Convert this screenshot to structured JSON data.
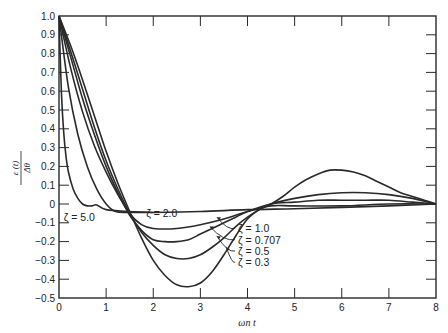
{
  "chart_data": {
    "type": "line",
    "title": "",
    "xlabel": "ωn t",
    "ylabel": "ε(t) / Δθ",
    "ylabel_num": "ε (t)",
    "ylabel_den": "Δθ",
    "xlim": [
      0,
      8
    ],
    "ylim": [
      -0.5,
      1.0
    ],
    "grid": false,
    "legend": "inline annotations",
    "x_ticks": [
      "0",
      "1",
      "2",
      "3",
      "4",
      "5",
      "6",
      "7",
      "8"
    ],
    "y_ticks": [
      "1.0",
      "0.9",
      "0.8",
      "0.7",
      "0.6",
      "0.5",
      "0.4",
      "0.3",
      "0.2",
      "0.1",
      "0",
      "-0.1",
      "-0.2",
      "-0.3",
      "-0.4",
      "-0.5"
    ],
    "series": [
      {
        "name": "ζ = 0.3",
        "x": [
          0,
          0.25,
          0.5,
          0.75,
          1.0,
          1.25,
          1.5,
          1.75,
          2.0,
          2.25,
          2.5,
          2.75,
          3.0,
          3.25,
          3.5,
          3.75,
          4.0,
          4.25,
          4.5,
          4.75,
          5.0,
          5.25,
          5.5,
          5.75,
          6.0,
          6.25,
          6.5,
          6.75,
          7.0,
          7.25,
          7.5,
          7.75,
          8.0
        ],
        "y": [
          1.0,
          0.84,
          0.66,
          0.47,
          0.28,
          0.11,
          -0.04,
          -0.18,
          -0.3,
          -0.38,
          -0.43,
          -0.44,
          -0.42,
          -0.36,
          -0.27,
          -0.17,
          -0.08,
          -0.03,
          0.0,
          0.04,
          0.09,
          0.13,
          0.16,
          0.18,
          0.18,
          0.17,
          0.15,
          0.12,
          0.09,
          0.06,
          0.04,
          0.02,
          0.0
        ]
      },
      {
        "name": "ζ = 0.5",
        "x": [
          0,
          0.25,
          0.5,
          0.75,
          1.0,
          1.25,
          1.5,
          1.75,
          2.0,
          2.25,
          2.5,
          2.75,
          3.0,
          3.25,
          3.5,
          3.75,
          4.0,
          4.25,
          4.5,
          5.0,
          5.5,
          6.0,
          6.5,
          7.0,
          7.5,
          8.0
        ],
        "y": [
          1.0,
          0.81,
          0.61,
          0.41,
          0.23,
          0.08,
          -0.05,
          -0.15,
          -0.22,
          -0.27,
          -0.29,
          -0.29,
          -0.27,
          -0.23,
          -0.18,
          -0.12,
          -0.07,
          -0.03,
          0.0,
          0.03,
          0.05,
          0.06,
          0.06,
          0.05,
          0.03,
          0.0
        ]
      },
      {
        "name": "ζ = 0.707",
        "x": [
          0,
          0.25,
          0.5,
          0.75,
          1.0,
          1.25,
          1.5,
          1.75,
          2.0,
          2.25,
          2.5,
          2.75,
          3.0,
          3.25,
          3.5,
          3.75,
          4.0,
          4.5,
          5.0,
          5.5,
          6.0,
          6.5,
          7.0,
          7.5,
          8.0
        ],
        "y": [
          1.0,
          0.78,
          0.56,
          0.37,
          0.2,
          0.06,
          -0.06,
          -0.14,
          -0.19,
          -0.2,
          -0.2,
          -0.19,
          -0.16,
          -0.13,
          -0.1,
          -0.07,
          -0.04,
          0.0,
          0.01,
          0.02,
          0.02,
          0.02,
          0.02,
          0.01,
          0.0
        ]
      },
      {
        "name": "ζ = 1.0",
        "x": [
          0,
          0.25,
          0.5,
          0.75,
          1.0,
          1.25,
          1.5,
          1.75,
          2.0,
          2.5,
          3.0,
          3.5,
          4.0,
          4.5,
          5.0,
          6.0,
          7.0,
          8.0
        ],
        "y": [
          1.0,
          0.72,
          0.49,
          0.31,
          0.17,
          0.05,
          -0.05,
          -0.11,
          -0.13,
          -0.13,
          -0.11,
          -0.08,
          -0.04,
          -0.01,
          -0.01,
          -0.01,
          0.0,
          0.0
        ]
      },
      {
        "name": "ζ = 2.0",
        "x": [
          0,
          0.2,
          0.4,
          0.6,
          0.8,
          1.0,
          1.2,
          1.5,
          2.0,
          3.0,
          4.0,
          5.0,
          6.0,
          7.0,
          8.0
        ],
        "y": [
          1.0,
          0.62,
          0.37,
          0.2,
          0.08,
          0.0,
          -0.04,
          -0.045,
          -0.045,
          -0.04,
          -0.03,
          -0.025,
          -0.018,
          -0.01,
          0.0
        ]
      },
      {
        "name": "ζ = 5.0",
        "x": [
          0,
          0.05,
          0.1,
          0.15,
          0.2,
          0.3,
          0.4,
          0.5,
          0.6,
          0.7,
          0.8,
          1.0,
          1.5,
          2.0
        ],
        "y": [
          1.0,
          0.6,
          0.38,
          0.25,
          0.17,
          0.08,
          0.03,
          0.0,
          -0.01,
          -0.01,
          -0.005,
          -0.03,
          -0.04,
          -0.045
        ]
      }
    ],
    "annotations": [
      {
        "text": "ζ = 5.0",
        "x": 0.1,
        "y": -0.07
      },
      {
        "text": "ζ = 2.0",
        "x": 1.85,
        "y": -0.05
      },
      {
        "text": "ζ = 1.0",
        "x": 3.8,
        "y": -0.13
      },
      {
        "text": "ζ = 0.707",
        "x": 3.8,
        "y": -0.19
      },
      {
        "text": "ζ = 0.5",
        "x": 3.8,
        "y": -0.25
      },
      {
        "text": "ζ = 0.3",
        "x": 3.8,
        "y": -0.31
      }
    ]
  }
}
